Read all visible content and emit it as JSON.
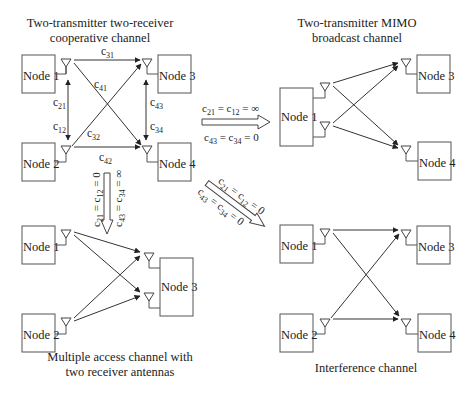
{
  "diagrams": {
    "cooperative": {
      "title_line1": "Two-transmitter two-receiver",
      "title_line2": "cooperative channel",
      "nodes": [
        "Node 1",
        "Node 2",
        "Node 3",
        "Node 4"
      ],
      "links": {
        "c31": "c",
        "c31_sub": "31",
        "c41": "c",
        "c41_sub": "41",
        "c21": "c",
        "c21_sub": "21",
        "c12": "c",
        "c12_sub": "12",
        "c32": "c",
        "c32_sub": "32",
        "c42": "c",
        "c42_sub": "42",
        "c43": "c",
        "c43_sub": "43",
        "c34": "c",
        "c34_sub": "34"
      }
    },
    "broadcast": {
      "title_line1": "Two-transmitter MIMO",
      "title_line2": "broadcast channel",
      "nodes": [
        "Node 1",
        "Node 3",
        "Node 4"
      ]
    },
    "mac": {
      "title_line1": "Multiple access channel with",
      "title_line2": "two receiver antennas",
      "nodes": [
        "Node 1",
        "Node 2",
        "Node 3"
      ]
    },
    "interference": {
      "title": "Interference channel",
      "nodes": [
        "Node 1",
        "Node 2",
        "Node 3",
        "Node 4"
      ]
    }
  },
  "transitions": {
    "to_broadcast": {
      "line1": "c21 = c12 = ∞",
      "line2": "c43 = c34 = 0",
      "l1": {
        "a": "c",
        "as": "21",
        "b": "= c",
        "bs": "12",
        "c": "= ∞"
      },
      "l2": {
        "a": "c",
        "as": "43",
        "b": "= c",
        "bs": "34",
        "c": "= 0"
      }
    },
    "to_mac": {
      "line1": "c21 = c12 = 0",
      "line2": "c43 = c34 = ∞",
      "l1": {
        "a": "c",
        "as": "21",
        "b": "= c",
        "bs": "12",
        "c": "= 0"
      },
      "l2": {
        "a": "c",
        "as": "43",
        "b": "= c",
        "bs": "34",
        "c": "= ∞"
      }
    },
    "to_interference": {
      "line1": "c21 = c12 = 0",
      "line2": "c43 = c34 = 0",
      "l1": {
        "a": "c",
        "as": "21",
        "b": "= c",
        "bs": "12",
        "c": "= 0"
      },
      "l2": {
        "a": "c",
        "as": "43",
        "b": "= c",
        "bs": "34",
        "c": "= 0"
      }
    }
  },
  "colors": {
    "line": "#333333",
    "box_stroke": "#555555",
    "text": "#222222",
    "background": "#ffffff"
  }
}
